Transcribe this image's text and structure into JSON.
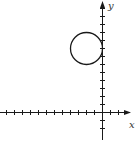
{
  "chart_data": {
    "type": "scatter",
    "title": "",
    "xlabel": "x",
    "ylabel": "y",
    "xlim": [
      -12.5,
      3.5
    ],
    "ylim": [
      -3.5,
      13.5
    ],
    "x_ticks": [
      -12,
      -11,
      -10,
      -9,
      -8,
      -7,
      -6,
      -5,
      -4,
      -3,
      -2,
      -1,
      1,
      2
    ],
    "y_ticks": [
      -2,
      -1,
      1,
      2,
      3,
      4,
      5,
      6,
      7,
      8,
      9,
      10,
      11,
      12,
      13
    ],
    "tick_labels_shown": false,
    "grid": false,
    "shapes": [
      {
        "type": "circle",
        "center": [
          -2,
          8
        ],
        "radius": 2
      }
    ]
  }
}
